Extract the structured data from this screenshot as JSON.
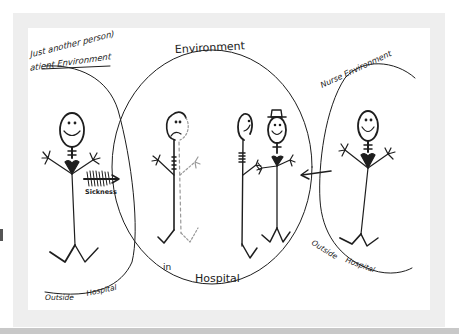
{
  "diagram": {
    "colors": {
      "ink": "#1e1e1e",
      "light_ink": "#777777",
      "frame": "#eeeeee",
      "sheet": "#ffffff",
      "bottom_bar": "#c8c8c8"
    },
    "regions": {
      "patient": {
        "title_line1": "Just another person)",
        "title_line2": "atient Environment",
        "bottom_left": "Outside",
        "bottom_right": "Hospital"
      },
      "center": {
        "title": "Environment",
        "bottom_left": "in",
        "bottom_right": "Hospital"
      },
      "nurse": {
        "title": "Nurse Environment",
        "bottom_left": "Outside",
        "bottom_right": "Hospital"
      }
    },
    "arrows": {
      "sickness_label": "Sickness"
    },
    "figures": [
      {
        "name": "patient-healthy",
        "expression": "smile"
      },
      {
        "name": "patient-sick",
        "expression": "frown"
      },
      {
        "name": "companion",
        "expression": "smile"
      },
      {
        "name": "nurse-in-hospital",
        "expression": "smile",
        "hat": true
      },
      {
        "name": "nurse-outside",
        "expression": "smile"
      }
    ]
  }
}
